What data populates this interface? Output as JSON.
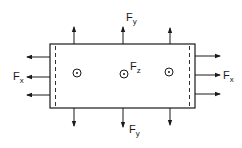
{
  "diagram": {
    "colors": {
      "stroke": "#1a1a1a",
      "background": "#ffffff"
    },
    "labels": {
      "fy_top": {
        "main": "F",
        "sub": "y"
      },
      "fy_bottom": {
        "main": "F",
        "sub": "y"
      },
      "fx_left": {
        "main": "F",
        "sub": "x"
      },
      "fx_right": {
        "main": "F",
        "sub": "x"
      },
      "fz_center": {
        "main": "F",
        "sub": "z"
      }
    },
    "arrows": {
      "top": {
        "direction": "up",
        "count": 3
      },
      "bottom": {
        "direction": "down",
        "count": 3
      },
      "left": {
        "direction": "left",
        "count": 3
      },
      "right": {
        "direction": "right",
        "count": 3
      }
    },
    "out_of_plane_symbols": {
      "count": 3,
      "symbol": "circle-dot"
    }
  }
}
